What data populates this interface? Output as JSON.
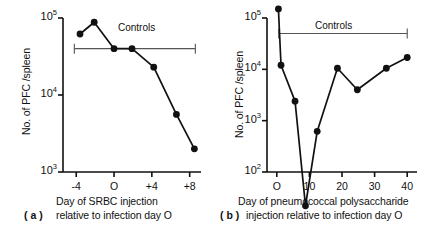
{
  "figure": {
    "panels": [
      {
        "tag": "( a )",
        "ylabel": "No. of PFC /spleen",
        "controls_label": "Controls",
        "caption_line1": "Day of SRBC injection",
        "caption_line2": "relative to infection day O",
        "yticks": [
          {
            "label": "10",
            "exp": "3",
            "value": 1000
          },
          {
            "label": "10",
            "exp": "4",
            "value": 10000
          },
          {
            "label": "10",
            "exp": "5",
            "value": 100000
          }
        ],
        "xticks": [
          {
            "label": "-4",
            "value": -4
          },
          {
            "label": "O",
            "value": 0
          },
          {
            "label": "+4",
            "value": 4
          },
          {
            "label": "+8",
            "value": 8
          }
        ]
      },
      {
        "tag": "( b )",
        "ylabel": "No. of PFC /spleen",
        "controls_label": "Controls",
        "caption_line1": "Day of pneumococcal polysaccharide",
        "caption_line2": "injection relative to infection day O",
        "yticks": [
          {
            "label": "10",
            "exp": "2",
            "value": 100
          },
          {
            "label": "10",
            "exp": "3",
            "value": 1000
          },
          {
            "label": "10",
            "exp": "4",
            "value": 10000
          },
          {
            "label": "10",
            "exp": "5",
            "value": 100000
          }
        ],
        "xticks": [
          {
            "label": "O",
            "value": 0
          },
          {
            "label": "10",
            "value": 10
          },
          {
            "label": "20",
            "value": 20
          },
          {
            "label": "30",
            "value": 30
          },
          {
            "label": "40",
            "value": 40
          }
        ]
      }
    ]
  },
  "chart_data": [
    {
      "type": "line",
      "panel": "a",
      "title": "",
      "xlabel": "Day of SRBC injection relative to infection day O",
      "ylabel": "No. of PFC /spleen",
      "yscale": "log",
      "ylim": [
        1000,
        100000
      ],
      "xlim": [
        -5.4,
        9.2
      ],
      "grid": false,
      "legend": false,
      "annotations": [
        {
          "text": "Controls",
          "x_start": -4.2,
          "x_end": 8.6,
          "y": 40000,
          "style": "horizontal-bracket"
        }
      ],
      "series": [
        {
          "name": "PFC per spleen",
          "marker": "filled-circle",
          "x": [
            -3.6,
            -2.1,
            0.0,
            1.9,
            4.2,
            6.6,
            8.5
          ],
          "y": [
            62000,
            88000,
            40000,
            40000,
            23000,
            5600,
            2000
          ]
        }
      ]
    },
    {
      "type": "line",
      "panel": "b",
      "title": "",
      "xlabel": "Day of pneumococcal polysaccharide injection relative to infection day O",
      "ylabel": "No. of PFC /spleen",
      "yscale": "log",
      "ylim": [
        100,
        100000
      ],
      "xlim": [
        -3.0,
        43.0
      ],
      "grid": false,
      "legend": false,
      "annotations": [
        {
          "text": "Controls",
          "x_start": 0.6,
          "x_end": 40.0,
          "y": 50000,
          "style": "horizontal-bracket"
        }
      ],
      "series": [
        {
          "name": "PFC per spleen",
          "marker": "filled-circle",
          "x": [
            0.5,
            1.3,
            5.6,
            8.8,
            12.4,
            18.6,
            24.7,
            33.6,
            40.0
          ],
          "y": [
            150000,
            12000,
            2400,
            22,
            620,
            10500,
            4000,
            10500,
            17000
          ]
        }
      ]
    }
  ]
}
